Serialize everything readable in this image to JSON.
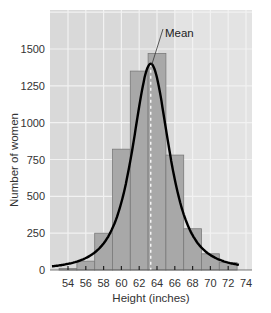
{
  "chart_data": {
    "type": "bar",
    "subtype": "histogram_with_normal_curve",
    "title": "",
    "xlabel": "Height (inches)",
    "ylabel": "Number of women",
    "x_ticks": [
      54,
      56,
      58,
      60,
      62,
      64,
      66,
      68,
      70,
      72,
      74
    ],
    "y_ticks": [
      0,
      250,
      500,
      750,
      1000,
      1250,
      1500
    ],
    "xlim": [
      52,
      76
    ],
    "ylim": [
      0,
      1700
    ],
    "grid": true,
    "bin_width": 2,
    "categories": [
      "53-55",
      "55-57",
      "57-59",
      "59-61",
      "61-63",
      "63-65",
      "65-67",
      "67-69",
      "69-71",
      "71-73"
    ],
    "bin_starts": [
      53,
      55,
      57,
      59,
      61,
      63,
      65,
      67,
      69,
      71
    ],
    "values": [
      10,
      60,
      250,
      820,
      1350,
      1470,
      780,
      280,
      110,
      50
    ],
    "curve": {
      "name": "Normal curve",
      "mean": 63.3,
      "peak": 1400,
      "sd": 2.6
    },
    "annotations": [
      {
        "text": "Mean",
        "x": 63.3,
        "style": "dashed vertical line"
      }
    ],
    "legend": null
  },
  "colors": {
    "background": "#ffffff",
    "plot_bg": "#d9d9d9",
    "plot_bg_right": "#e3e3e3",
    "grid": "#f2f2f2",
    "bar_fill": "#a8a8a8",
    "bar_edge": "#7a7a7a",
    "curve": "#000000",
    "mean_line": "#ffffff"
  }
}
